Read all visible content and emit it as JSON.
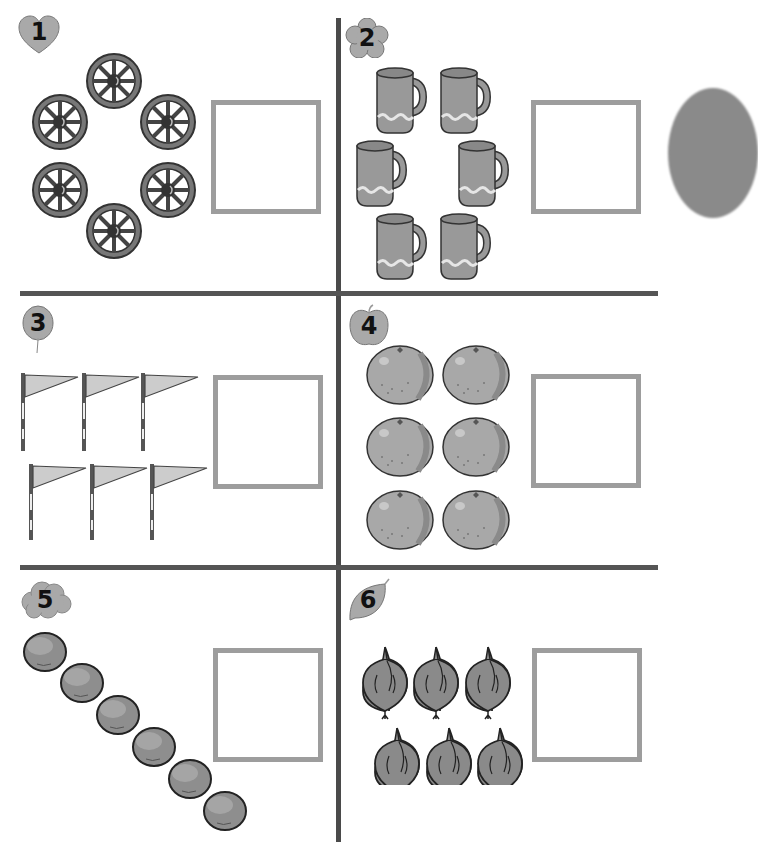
{
  "worksheet": {
    "title": "Count the objects and write the number",
    "colors": {
      "divider": "#4a4a4a",
      "answer_box_border": "#9d9d9d",
      "badge_fill": "#a9a9a9",
      "item_fill": "#9a9a9a",
      "item_outline": "#3a3a3a"
    },
    "sections": [
      {
        "number": "1",
        "badge_shape": "heart",
        "item": "wagon-wheel",
        "count": 6,
        "answer": ""
      },
      {
        "number": "2",
        "badge_shape": "flower",
        "item": "mug",
        "count": 6,
        "answer": ""
      },
      {
        "number": "3",
        "badge_shape": "balloon",
        "item": "flag",
        "count": 6,
        "answer": ""
      },
      {
        "number": "4",
        "badge_shape": "apple",
        "item": "orange",
        "count": 6,
        "answer": ""
      },
      {
        "number": "5",
        "badge_shape": "cloud",
        "item": "plum",
        "count": 6,
        "answer": ""
      },
      {
        "number": "6",
        "badge_shape": "leaf",
        "item": "onion",
        "count": 6,
        "answer": ""
      }
    ]
  }
}
